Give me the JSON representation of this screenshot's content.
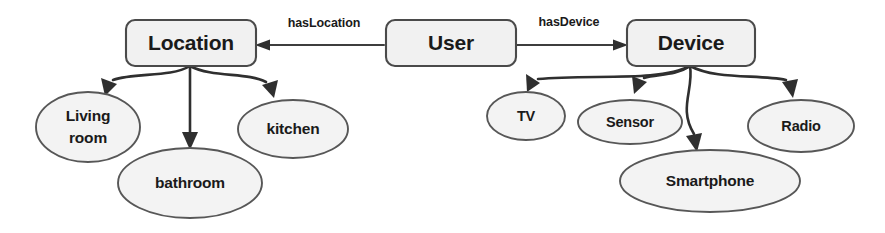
{
  "diagram": {
    "type": "ontology-graph",
    "background_color": "#ffffff",
    "palette": {
      "node_fill": "#f1f1f1",
      "node_stroke": "#4a4a4a",
      "ellipse_fill": "#f3f3f3",
      "ellipse_stroke": "#575757",
      "edge_color": "#2f2f2f",
      "text_color": "#1a1a1a"
    },
    "classes": [
      {
        "id": "location",
        "label": "Location",
        "shape": "rounded-rect"
      },
      {
        "id": "user",
        "label": "User",
        "shape": "rounded-rect"
      },
      {
        "id": "device",
        "label": "Device",
        "shape": "rounded-rect"
      }
    ],
    "relations": [
      {
        "id": "has-location",
        "label": "hasLocation",
        "from": "user",
        "to": "location",
        "direction": "left"
      },
      {
        "id": "has-device",
        "label": "hasDevice",
        "from": "user",
        "to": "device",
        "direction": "right"
      }
    ],
    "location_instances": [
      {
        "id": "living-room",
        "label_line1": "Living",
        "label_line2": "room",
        "label": "Living room"
      },
      {
        "id": "bathroom",
        "label": "bathroom"
      },
      {
        "id": "kitchen",
        "label": "kitchen"
      }
    ],
    "device_instances": [
      {
        "id": "tv",
        "label": "TV"
      },
      {
        "id": "sensor",
        "label": "Sensor"
      },
      {
        "id": "smartphone",
        "label": "Smartphone"
      },
      {
        "id": "radio",
        "label": "Radio"
      }
    ]
  }
}
